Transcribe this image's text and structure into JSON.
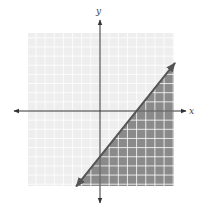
{
  "chart_data": {
    "type": "inequality-graph",
    "title": "",
    "xlabel": "x",
    "ylabel": "y",
    "xlim": [
      -8,
      8
    ],
    "ylim": [
      -8,
      8
    ],
    "grid": true,
    "grid_step": 1,
    "boundary_line": {
      "slope": 1.25,
      "intercept": -5,
      "x_intercept": 4,
      "y_intercept": -5,
      "style": "solid",
      "arrows": "both"
    },
    "inequality": "y <= (5/4)x - 5",
    "shaded_region": "below-right of line",
    "legend": null
  },
  "colors": {
    "grid_bg_light": "#eeeeee",
    "grid_bg_dark": "#8a8a8a",
    "grid_line": "#ffffff",
    "axis": "#333333",
    "boundary": "#555555"
  },
  "labels": {
    "x_axis": "x",
    "y_axis": "y"
  }
}
